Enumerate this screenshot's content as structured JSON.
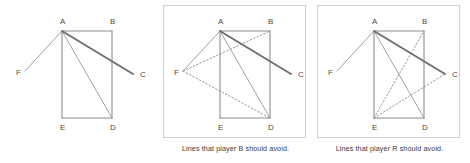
{
  "figure": {
    "title": "",
    "panel_count": 3,
    "stroke_colors": {
      "rectangle": "#8c8c8c",
      "thin_line": "#a2a2a2",
      "bold_line": "#6e6e6e",
      "dotted_line": "#9a9a9a",
      "panel_border": "#cfcfcf",
      "label_text": "#4a4a4a",
      "caption_text": "#3b3b3b"
    },
    "vertices": {
      "A": {
        "x": 62,
        "y": 31,
        "label": "A",
        "label_x": 60,
        "label_y": 24
      },
      "B": {
        "x": 112,
        "y": 31,
        "label": "B",
        "label_x": 110,
        "label_y": 24
      },
      "C": {
        "x": 133,
        "y": 74,
        "label": "C",
        "label_x": 140,
        "label_y": 77
      },
      "D": {
        "x": 112,
        "y": 118,
        "label": "D",
        "label_x": 110,
        "label_y": 130
      },
      "E": {
        "x": 62,
        "y": 118,
        "label": "E",
        "label_x": 60,
        "label_y": 130
      },
      "F": {
        "x": 25,
        "y": 71,
        "label": "F",
        "label_x": 16,
        "label_y": 75
      }
    },
    "panels": [
      {
        "id": "panel-1",
        "name": "base-figure",
        "framed": false,
        "caption": "",
        "solid_lines": [
          {
            "from": "A",
            "to": "B",
            "style": "rect"
          },
          {
            "from": "B",
            "to": "D",
            "style": "rect"
          },
          {
            "from": "D",
            "to": "E",
            "style": "rect"
          },
          {
            "from": "E",
            "to": "A",
            "style": "rect"
          },
          {
            "from": "A",
            "to": "F",
            "style": "thin"
          },
          {
            "from": "A",
            "to": "D",
            "style": "thin"
          },
          {
            "from": "A",
            "to": "C",
            "style": "bold"
          }
        ],
        "dotted_lines": []
      },
      {
        "id": "panel-2",
        "name": "player-b-avoid",
        "framed": true,
        "caption": "Lines that player B should avoid.",
        "solid_lines": [
          {
            "from": "A",
            "to": "B",
            "style": "rect"
          },
          {
            "from": "B",
            "to": "D",
            "style": "rect"
          },
          {
            "from": "D",
            "to": "E",
            "style": "rect"
          },
          {
            "from": "E",
            "to": "A",
            "style": "rect"
          },
          {
            "from": "A",
            "to": "F",
            "style": "thin"
          },
          {
            "from": "A",
            "to": "D",
            "style": "thin"
          },
          {
            "from": "A",
            "to": "C",
            "style": "bold"
          }
        ],
        "dotted_lines": [
          {
            "from": "F",
            "to": "B"
          },
          {
            "from": "F",
            "to": "D"
          }
        ]
      },
      {
        "id": "panel-3",
        "name": "player-r-avoid",
        "framed": true,
        "caption": "Lines that player R should avoid.",
        "solid_lines": [
          {
            "from": "A",
            "to": "B",
            "style": "rect"
          },
          {
            "from": "B",
            "to": "D",
            "style": "rect"
          },
          {
            "from": "D",
            "to": "E",
            "style": "rect"
          },
          {
            "from": "E",
            "to": "A",
            "style": "rect"
          },
          {
            "from": "A",
            "to": "F",
            "style": "thin"
          },
          {
            "from": "A",
            "to": "D",
            "style": "thin"
          },
          {
            "from": "A",
            "to": "C",
            "style": "bold"
          }
        ],
        "dotted_lines": [
          {
            "from": "E",
            "to": "B"
          },
          {
            "from": "E",
            "to": "C"
          }
        ]
      }
    ]
  }
}
